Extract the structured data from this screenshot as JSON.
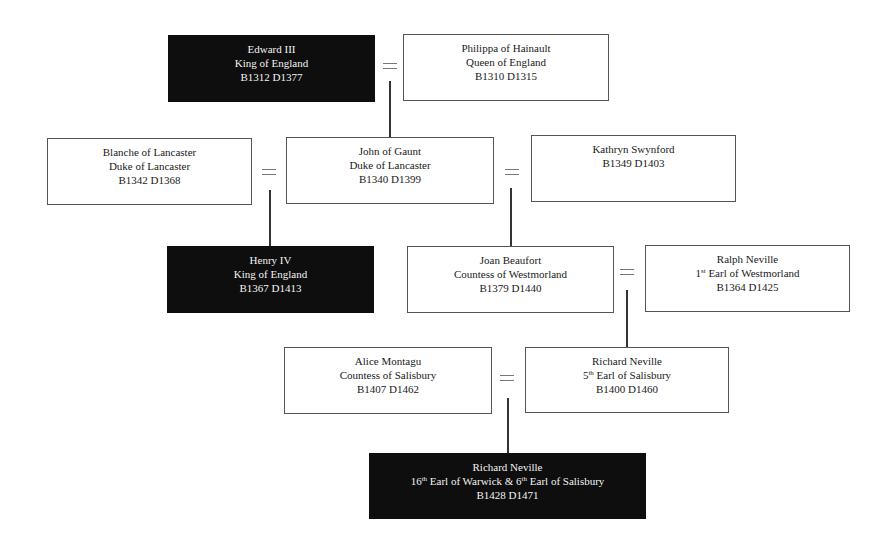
{
  "diagram": {
    "type": "family-tree",
    "people": [
      {
        "id": "edward-iii",
        "name": "Edward III",
        "title": "King of England",
        "dates": "B1312 D1377",
        "highlight": true
      },
      {
        "id": "philippa",
        "name": "Philippa of Hainault",
        "title": "Queen of England",
        "dates": "B1310 D1315",
        "highlight": false
      },
      {
        "id": "blanche",
        "name": "Blanche of Lancaster",
        "title": "Duke of Lancaster",
        "dates": "B1342 D1368",
        "highlight": false
      },
      {
        "id": "john-of-gaunt",
        "name": "John of Gaunt",
        "title": "Duke of Lancaster",
        "dates": "B1340 D1399",
        "highlight": false
      },
      {
        "id": "kathryn",
        "name": "Kathryn Swynford",
        "title": "",
        "dates": "B1349 D1403",
        "highlight": false
      },
      {
        "id": "henry-iv",
        "name": "Henry IV",
        "title": "King of England",
        "dates": "B1367 D1413",
        "highlight": true
      },
      {
        "id": "joan-beaufort",
        "name": "Joan Beaufort",
        "title": "Countess of Westmorland",
        "dates": "B1379 D1440",
        "highlight": false
      },
      {
        "id": "ralph-neville",
        "name": "Ralph Neville",
        "title_ordinal": "1",
        "title_sup": "st",
        "title_rest": " Earl of Westmorland",
        "dates": "B1364 D1425",
        "highlight": false
      },
      {
        "id": "alice-montagu",
        "name": "Alice Montagu",
        "title": "Countess of Salisbury",
        "dates": "B1407 D1462",
        "highlight": false
      },
      {
        "id": "richard-neville-5th",
        "name": "Richard Neville",
        "title_ordinal": "5",
        "title_sup": "th",
        "title_rest": " Earl of Salisbury",
        "dates": "B1400 D1460",
        "highlight": false
      },
      {
        "id": "richard-neville-16th",
        "name": "Richard Neville",
        "title_a": "16",
        "title_a_sup": "th",
        "title_b": " Earl of Warwick & 6",
        "title_b_sup": "th",
        "title_c": " Earl of Salisbury",
        "dates": "B1428 D1471",
        "highlight": true
      }
    ],
    "marriages": [
      {
        "a": "edward-iii",
        "b": "philippa",
        "symbol": "="
      },
      {
        "a": "blanche",
        "b": "john-of-gaunt",
        "symbol": "="
      },
      {
        "a": "john-of-gaunt",
        "b": "kathryn",
        "symbol": "="
      },
      {
        "a": "joan-beaufort",
        "b": "ralph-neville",
        "symbol": "="
      },
      {
        "a": "alice-montagu",
        "b": "richard-neville-5th",
        "symbol": "="
      }
    ],
    "descent": [
      {
        "from": [
          "edward-iii",
          "philippa"
        ],
        "to": "john-of-gaunt"
      },
      {
        "from": [
          "blanche",
          "john-of-gaunt"
        ],
        "to": "henry-iv"
      },
      {
        "from": [
          "john-of-gaunt",
          "kathryn"
        ],
        "to": "joan-beaufort"
      },
      {
        "from": [
          "joan-beaufort",
          "ralph-neville"
        ],
        "to": "richard-neville-5th"
      },
      {
        "from": [
          "alice-montagu",
          "richard-neville-5th"
        ],
        "to": "richard-neville-16th"
      }
    ],
    "colors": {
      "highlight_bg": "#0e0e0e",
      "highlight_text": "#f2f2f2",
      "box_border": "#555555",
      "line": "#333333"
    }
  }
}
